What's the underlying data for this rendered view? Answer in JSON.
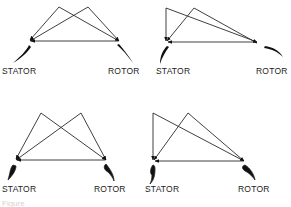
{
  "diagram": {
    "type": "velocity-triangles",
    "panels": [
      {
        "id": "top-left",
        "stator_label": "STATOR",
        "rotor_label": "ROTOR",
        "apex_a": [
          59,
          7
        ],
        "apex_b": [
          88,
          7
        ],
        "stator_point": [
          29,
          41
        ],
        "rotor_point": [
          119,
          41
        ]
      },
      {
        "id": "top-right",
        "stator_label": "STATOR",
        "rotor_label": "ROTOR",
        "apex_a": [
          166,
          8
        ],
        "apex_b": [
          194,
          8
        ],
        "stator_point": [
          166,
          42
        ],
        "rotor_point": [
          258,
          43
        ]
      },
      {
        "id": "bottom-left",
        "stator_label": "STATOR",
        "rotor_label": "ROTOR",
        "apex_a": [
          41,
          113
        ],
        "apex_b": [
          81,
          113
        ],
        "stator_point": [
          15,
          160
        ],
        "rotor_point": [
          106,
          160
        ]
      },
      {
        "id": "bottom-right",
        "stator_label": "STATOR",
        "rotor_label": "ROTOR",
        "apex_a": [
          153,
          113
        ],
        "apex_b": [
          188,
          113
        ],
        "stator_point": [
          153,
          161
        ],
        "rotor_point": [
          245,
          161
        ]
      }
    ],
    "caption": "Figure"
  }
}
